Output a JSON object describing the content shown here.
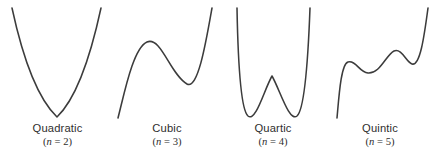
{
  "figure": {
    "background_color": "#ffffff",
    "curve_color": "#3c3c3c",
    "text_color": "#2e2e2e",
    "width": 435,
    "height": 156
  },
  "panels": [
    {
      "id": "quadratic",
      "name": "Quadratic",
      "degree_label": "(n = 2)",
      "degree_prefix": "(",
      "degree_var": "n",
      "degree_eq": " = ",
      "degree_value": "2",
      "degree_suffix": ")",
      "path": "M 12 8 C 20 45, 34 95, 57 117 C 80 95, 93 45, 101 8"
    },
    {
      "id": "cubic",
      "name": "Cubic",
      "degree_label": "(n = 3)",
      "degree_prefix": "(",
      "degree_var": "n",
      "degree_eq": " = ",
      "degree_value": "3",
      "degree_suffix": ")",
      "path": "M 118 118 C 124 95, 133 48, 147 42 C 161 36, 170 74, 187 84 C 198 90, 206 42, 212 8"
    },
    {
      "id": "quartic",
      "name": "Quartic",
      "degree_label": "(n = 4)",
      "degree_prefix": "(",
      "degree_var": "n",
      "degree_eq": " = ",
      "degree_value": "4",
      "degree_suffix": ")",
      "path": "M 237 8 C 238 62, 241 110, 248 116 C 256 122, 264 90, 272 76 C 280 90, 289 122, 297 116 C 304 110, 308 62, 310 8"
    },
    {
      "id": "quintic",
      "name": "Quintic",
      "degree_label": "(n = 5)",
      "degree_prefix": "(",
      "degree_var": "n",
      "degree_eq": " = ",
      "degree_value": "5",
      "degree_suffix": ")",
      "path": "M 337 118 C 339 96, 341 64, 348 62 C 356 60, 359 72, 368 73 C 380 74, 386 55, 394 51 C 402 48, 406 62, 412 64 C 420 66, 424 38, 428 8"
    }
  ],
  "chart_data": {
    "type": "line",
    "xlabel": "",
    "ylabel": "",
    "grid": false,
    "legend": "none",
    "axis_visible": false,
    "note": "Four schematic polynomial graphs; vertical axis increases upward (SVG y is inverted).",
    "series": [
      {
        "name": "Quadratic",
        "degree": 2,
        "turning_points": 1,
        "end_behavior": "up-up",
        "annotation": "(n = 2)",
        "points_px": [
          {
            "x": 12,
            "y": 8
          },
          {
            "x": 34,
            "y": 95
          },
          {
            "x": 57,
            "y": 117
          },
          {
            "x": 80,
            "y": 95
          },
          {
            "x": 101,
            "y": 8
          }
        ],
        "extrema_px": [
          {
            "kind": "minimum",
            "x": 57,
            "y": 117
          }
        ]
      },
      {
        "name": "Cubic",
        "degree": 3,
        "turning_points": 2,
        "end_behavior": "down-up",
        "annotation": "(n = 3)",
        "points_px": [
          {
            "x": 118,
            "y": 118
          },
          {
            "x": 147,
            "y": 42
          },
          {
            "x": 167,
            "y": 62
          },
          {
            "x": 187,
            "y": 84
          },
          {
            "x": 212,
            "y": 8
          }
        ],
        "extrema_px": [
          {
            "kind": "maximum",
            "x": 147,
            "y": 42
          },
          {
            "kind": "minimum",
            "x": 187,
            "y": 84
          }
        ]
      },
      {
        "name": "Quartic",
        "degree": 4,
        "turning_points": 3,
        "end_behavior": "up-up",
        "annotation": "(n = 4)",
        "points_px": [
          {
            "x": 237,
            "y": 8
          },
          {
            "x": 248,
            "y": 116
          },
          {
            "x": 272,
            "y": 76
          },
          {
            "x": 297,
            "y": 116
          },
          {
            "x": 310,
            "y": 8
          }
        ],
        "extrema_px": [
          {
            "kind": "minimum",
            "x": 248,
            "y": 116
          },
          {
            "kind": "maximum",
            "x": 272,
            "y": 76
          },
          {
            "kind": "minimum",
            "x": 297,
            "y": 116
          }
        ]
      },
      {
        "name": "Quintic",
        "degree": 5,
        "turning_points": 4,
        "end_behavior": "down-up",
        "annotation": "(n = 5)",
        "points_px": [
          {
            "x": 337,
            "y": 118
          },
          {
            "x": 348,
            "y": 62
          },
          {
            "x": 368,
            "y": 73
          },
          {
            "x": 394,
            "y": 51
          },
          {
            "x": 412,
            "y": 64
          },
          {
            "x": 428,
            "y": 8
          }
        ],
        "extrema_px": [
          {
            "kind": "maximum",
            "x": 348,
            "y": 62
          },
          {
            "kind": "minimum",
            "x": 368,
            "y": 73
          },
          {
            "kind": "maximum",
            "x": 394,
            "y": 51
          },
          {
            "kind": "minimum",
            "x": 412,
            "y": 64
          }
        ]
      }
    ]
  }
}
